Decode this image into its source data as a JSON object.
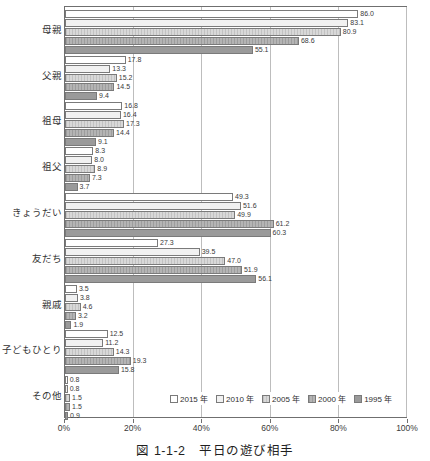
{
  "figure": {
    "title": "図 1-1-2　平日の遊び相手"
  },
  "chart_data": {
    "type": "bar",
    "orientation": "horizontal",
    "title": "図 1-1-2　平日の遊び相手",
    "xlabel": "",
    "ylabel": "",
    "xlim": [
      0,
      100
    ],
    "xticks": [
      0,
      20,
      40,
      60,
      80,
      100
    ],
    "xtick_labels": [
      "0%",
      "20%",
      "40%",
      "60%",
      "80%",
      "100%"
    ],
    "grid": true,
    "legend_position": "bottom-center",
    "categories": [
      "母親",
      "父親",
      "祖母",
      "祖父",
      "きょうだい",
      "友だち",
      "親戚",
      "子どもひとり",
      "その他"
    ],
    "series": [
      {
        "name": "2015 年",
        "color": "#ffffff",
        "values": [
          86.0,
          17.8,
          16.8,
          8.3,
          49.3,
          27.3,
          3.5,
          12.5,
          0.8
        ]
      },
      {
        "name": "2010 年",
        "color": "#f1f1f1",
        "values": [
          83.1,
          13.3,
          16.4,
          8.0,
          51.6,
          39.5,
          3.8,
          11.2,
          0.8
        ]
      },
      {
        "name": "2005 年",
        "color": "#d8d8d8",
        "values": [
          80.9,
          15.2,
          17.3,
          8.9,
          49.9,
          47.0,
          4.6,
          14.3,
          1.5
        ]
      },
      {
        "name": "2000 年",
        "color": "#b4b4b4",
        "values": [
          68.6,
          14.5,
          14.4,
          7.3,
          61.2,
          51.9,
          3.2,
          19.3,
          1.5
        ]
      },
      {
        "name": "1995 年",
        "color": "#9a9a9a",
        "values": [
          55.1,
          9.4,
          9.1,
          3.7,
          60.3,
          56.1,
          1.9,
          15.8,
          0.9
        ]
      }
    ]
  },
  "legend": {
    "items": [
      {
        "label": "2015 年"
      },
      {
        "label": "2010 年"
      },
      {
        "label": "2005 年"
      },
      {
        "label": "2000 年"
      },
      {
        "label": "1995 年"
      }
    ]
  }
}
